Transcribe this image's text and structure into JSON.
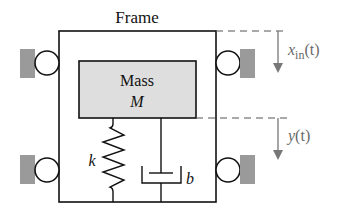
{
  "title": "Frame",
  "mass": {
    "label": "Mass",
    "symbol": "M"
  },
  "spring": {
    "symbol": "k"
  },
  "damper": {
    "symbol": "b"
  },
  "input_displacement": {
    "var": "x",
    "sub": "in",
    "arg": "(t)"
  },
  "output_displacement": {
    "var": "y",
    "arg": "(t)"
  },
  "colors": {
    "line": "#111111",
    "mass_fill": "#dedede",
    "ground_fill": "#9a9a9a",
    "annotation": "#777777"
  }
}
